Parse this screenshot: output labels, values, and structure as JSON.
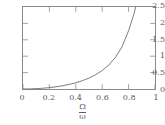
{
  "chart_data": {
    "type": "line",
    "title": "",
    "subtitle": "",
    "xlabel_numerator": "Ω",
    "xlabel_denominator": "ω",
    "xlabel": "Ω/ω",
    "ylabel": "",
    "xlim": [
      0,
      1
    ],
    "ylim": [
      0,
      2.5
    ],
    "grid": false,
    "legend": null,
    "xticks": [
      0,
      0.2,
      0.4,
      0.6,
      0.8,
      1
    ],
    "xticklabels": [
      "0",
      "0.2",
      "0.4",
      "0.6",
      "0.8",
      "1"
    ],
    "yticks": [
      0,
      0.5,
      1,
      1.5,
      2,
      2.5
    ],
    "yticklabels": [
      "0",
      "0.5",
      "1",
      "1.5",
      "2",
      "2.5"
    ],
    "series": [
      {
        "name": "curve",
        "color": "#6e6e6e",
        "x": [
          0.0,
          0.05,
          0.1,
          0.15,
          0.2,
          0.25,
          0.3,
          0.35,
          0.4,
          0.45,
          0.5,
          0.55,
          0.6,
          0.65,
          0.7,
          0.75,
          0.8,
          0.84,
          0.87,
          0.9,
          0.92,
          0.94,
          0.95,
          0.96,
          0.965,
          0.97,
          0.975,
          0.98,
          0.983,
          0.985
        ],
        "y": [
          0.0,
          0.003,
          0.01,
          0.023,
          0.042,
          0.067,
          0.099,
          0.14,
          0.19,
          0.254,
          0.333,
          0.433,
          0.563,
          0.733,
          0.961,
          1.286,
          1.778,
          2.283,
          2.76,
          3.4,
          3.96,
          4.7,
          5.2,
          5.8,
          6.2,
          6.6,
          7.1,
          7.7,
          8.2,
          8.6
        ]
      }
    ]
  },
  "axes": {
    "tick_direction": "in",
    "frame": "box",
    "frame_color": "#8a8a8a"
  }
}
